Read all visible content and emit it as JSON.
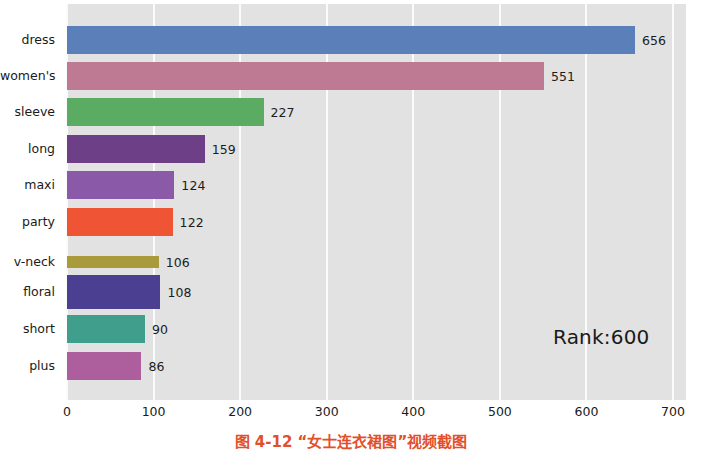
{
  "figure": {
    "background": "#ffffff",
    "plot_background": "#e2e2e2",
    "gridline_color": "#fbfbfb",
    "annotation": "Rank:600",
    "caption": "图 4-12  “女士连衣裙图”视频截图"
  },
  "chart_data": {
    "type": "bar",
    "orientation": "horizontal",
    "title": "",
    "xlabel": "",
    "ylabel": "",
    "categories": [
      "dress",
      "women's",
      "sleeve",
      "long",
      "maxi",
      "party",
      "v-neck",
      "floral",
      "short",
      "plus"
    ],
    "values": [
      656,
      551,
      227,
      159,
      124,
      122,
      106,
      108,
      90,
      86
    ],
    "value_labels": [
      "656",
      "551",
      "227",
      "159",
      "124",
      "122",
      "106",
      "108",
      "90",
      "86"
    ],
    "colors": [
      "#5b7fb8",
      "#bd7a92",
      "#5cab63",
      "#6d3f86",
      "#8a5aa8",
      "#ef5434",
      "#a99a3c",
      "#4a3f91",
      "#3f9e8c",
      "#ac5f9c"
    ],
    "xlim": [
      0,
      715
    ],
    "xticks": [
      0,
      100,
      200,
      300,
      400,
      500,
      600,
      700
    ],
    "xtick_labels": [
      "0",
      "100",
      "200",
      "300",
      "400",
      "500",
      "600",
      "700"
    ],
    "grid": true,
    "grid_axis": "x",
    "legend": false,
    "annotations": [
      {
        "text": "Rank:600",
        "x": 565,
        "y": 1.6
      }
    ]
  }
}
